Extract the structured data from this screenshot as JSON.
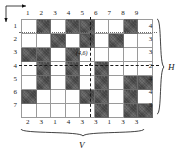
{
  "figure": {
    "type": "binary-grid-tomography",
    "rows": 7,
    "cols": 9,
    "point_label": "(4,6)",
    "h_axis_name": "H",
    "v_axis_name": "V",
    "ink_color": "#5c5c5c",
    "blank_color": "#ffffff",
    "grid_line_color": "#9a9a9a"
  },
  "column_headers": [
    "1",
    "2",
    "3",
    "4",
    "5",
    "6",
    "7",
    "8",
    "9"
  ],
  "row_headers": [
    "1",
    "2",
    "3",
    "4",
    "5",
    "6",
    "7"
  ],
  "h_sums": [
    "4",
    "3",
    "3",
    "2",
    "4",
    "4",
    "3"
  ],
  "v_sums": [
    "2",
    "3",
    "1",
    "4",
    "3",
    "3",
    "1",
    "3",
    "3"
  ],
  "chart_data": {
    "type": "heatmap",
    "title": "",
    "xlabel": "V",
    "ylabel": "H",
    "categories": [
      "1",
      "2",
      "3",
      "4",
      "5",
      "6",
      "7",
      "8",
      "9"
    ],
    "row_categories": [
      "1",
      "2",
      "3",
      "4",
      "5",
      "6",
      "7"
    ],
    "cells": [
      [
        0,
        1,
        0,
        1,
        1,
        0,
        0,
        1,
        0
      ],
      [
        0,
        0,
        1,
        0,
        1,
        0,
        1,
        0,
        0
      ],
      [
        1,
        1,
        0,
        1,
        0,
        0,
        0,
        0,
        0
      ],
      [
        0,
        1,
        0,
        1,
        0,
        1,
        0,
        0,
        0
      ],
      [
        0,
        1,
        0,
        1,
        0,
        1,
        0,
        1,
        1
      ],
      [
        1,
        0,
        0,
        0,
        1,
        1,
        0,
        1,
        0
      ],
      [
        0,
        0,
        0,
        0,
        0,
        1,
        0,
        1,
        1
      ]
    ],
    "row_sums": [
      4,
      3,
      3,
      2,
      4,
      4,
      3
    ],
    "col_sums": [
      2,
      3,
      1,
      4,
      3,
      3,
      1,
      3,
      3
    ],
    "annotations": [
      {
        "text": "(4,6)",
        "row": 4,
        "col": 6
      }
    ],
    "grid": true,
    "legend": "none"
  }
}
